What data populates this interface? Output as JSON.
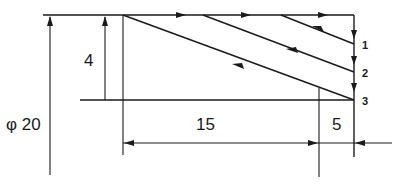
{
  "diagram": {
    "type": "turning-tool-path-taper",
    "labels": {
      "diameter": "φ 20",
      "height": "4",
      "length_taper": "15",
      "length_end": "5"
    },
    "passes": [
      {
        "id": "pass-1",
        "label": "1"
      },
      {
        "id": "pass-2",
        "label": "2"
      },
      {
        "id": "pass-3",
        "label": "3"
      }
    ],
    "colors": {
      "line": "#1a1a1a",
      "background": "#ffffff"
    }
  }
}
